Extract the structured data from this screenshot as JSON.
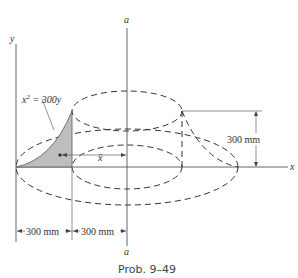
{
  "figure": {
    "caption": "Prob. 9–49",
    "curve_equation": "x² = 300y",
    "curve_lhs": "x",
    "curve_exp": "2",
    "curve_rhs": " = 300y",
    "axis_labels": {
      "x": "x",
      "y": "y",
      "a_top": "a",
      "a_bottom": "a"
    },
    "centroid_label": "x̄",
    "dimensions": {
      "height": "300 mm",
      "left_width": "300 mm",
      "right_width": "300 mm"
    },
    "shaded_color": "#bdbdbd"
  }
}
